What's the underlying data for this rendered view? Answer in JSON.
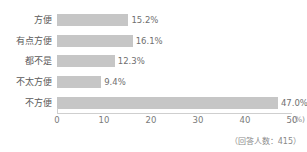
{
  "chart_data": {
    "type": "bar",
    "orientation": "horizontal",
    "title": "",
    "xlabel": "",
    "ylabel": "",
    "xlim": [
      0,
      50
    ],
    "xticks": [
      0,
      10,
      20,
      30,
      40,
      50
    ],
    "xtick_labels": [
      "0",
      "10",
      "20",
      "30",
      "40",
      "50"
    ],
    "x_unit_label": "(%)",
    "grid": false,
    "legend": null,
    "bar_color": "#c6c6c6",
    "categories": [
      "方便",
      "有点方便",
      "都不是",
      "不太方便",
      "不方便"
    ],
    "values": [
      15.2,
      16.1,
      12.3,
      9.4,
      47.0
    ],
    "value_labels": [
      "15.2%",
      "16.1%",
      "12.3%",
      "9.4%",
      "47.0%"
    ],
    "annotation": "（回答人数：415）"
  }
}
